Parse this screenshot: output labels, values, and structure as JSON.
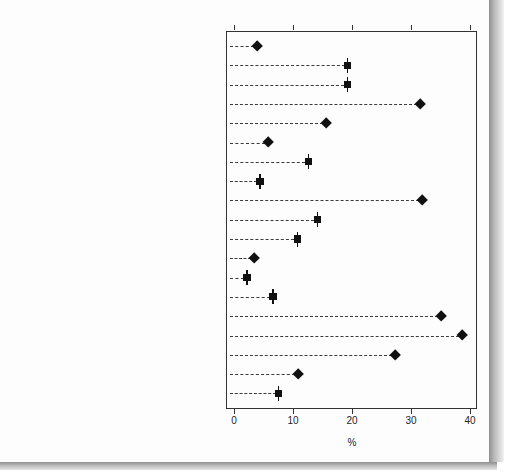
{
  "chart_data": {
    "type": "scatter",
    "title": "",
    "subtitle": "",
    "xlabel": "%",
    "ylabel": "",
    "xlim": [
      0,
      40
    ],
    "xticks": [
      0,
      10,
      20,
      30,
      40
    ],
    "xtick_labels": [
      "0",
      "10",
      "20",
      "30",
      "40"
    ],
    "grid": false,
    "legend": null,
    "orientation": "horizontal",
    "categories": [
      "Agriculture, forestry and fishing",
      "Mining",
      "Manufacturing",
      "Electricity, gas, water and waste services",
      "Construction",
      "Wholesale trade",
      "Retail trade",
      "Accommodation and food services",
      "Transport, postal and warehousing",
      "Information media and telecommunications",
      "Financial and insurance services",
      "Rental, hiring and real estate services",
      "Professional, scientific and technical services",
      "Administrative and support services",
      "Public administration and safety",
      "Education and training",
      "Health care and social assistance",
      "Arts and recreation services",
      "Other services"
    ],
    "values": [
      3.9,
      19.3,
      19.2,
      31.5,
      15.6,
      5.8,
      12.6,
      4.4,
      31.9,
      14.1,
      10.7,
      3.4,
      2.2,
      6.6,
      35.1,
      38.7,
      27.3,
      10.8,
      7.6
    ],
    "marker_styles": [
      "diamond",
      "square",
      "square",
      "diamond",
      "diamond",
      "diamond",
      "square",
      "square",
      "diamond",
      "square",
      "square",
      "diamond",
      "square",
      "square",
      "diamond",
      "diamond",
      "diamond",
      "diamond",
      "square"
    ]
  },
  "axis": {
    "x_title": "%"
  }
}
